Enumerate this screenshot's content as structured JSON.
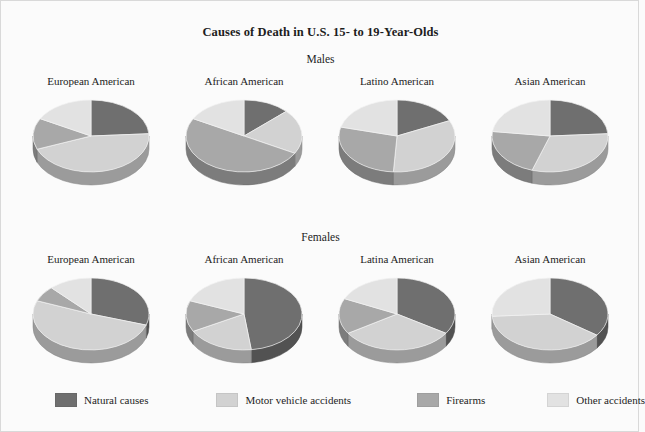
{
  "figure": {
    "title": "Causes of Death in U.S. 15- to 19-Year-Olds",
    "background_color": "#fbfbfb",
    "border_color": "#d9d9d9"
  },
  "sections": [
    {
      "key": "males",
      "label": "Males"
    },
    {
      "key": "females",
      "label": "Females"
    }
  ],
  "legend": {
    "items": [
      {
        "label": "Natural causes",
        "color": "#6f6f6f"
      },
      {
        "label": "Motor vehicle accidents",
        "color": "#d2d2d2"
      },
      {
        "label": "Firearms",
        "color": "#a8a8a8"
      },
      {
        "label": "Other accidents",
        "color": "#e2e2e2"
      }
    ]
  },
  "chart_data": {
    "type": "pie",
    "title": "Causes of Death in U.S. 15- to 19-Year-Olds",
    "categories": [
      "Natural causes",
      "Motor vehicle accidents",
      "Firearms",
      "Other accidents"
    ],
    "colors": [
      "#6f6f6f",
      "#d2d2d2",
      "#a8a8a8",
      "#e2e2e2"
    ],
    "units": "percent",
    "legend_position": "bottom",
    "grid": false,
    "panels": [
      {
        "group": "Males",
        "name": "European American",
        "values": [
          24,
          45,
          14,
          17
        ]
      },
      {
        "group": "Males",
        "name": "African American",
        "values": [
          13,
          20,
          50,
          17
        ]
      },
      {
        "group": "Males",
        "name": "Latino American",
        "values": [
          18,
          33,
          28,
          21
        ]
      },
      {
        "group": "Males",
        "name": "Asian American",
        "values": [
          24,
          31,
          22,
          23
        ]
      },
      {
        "group": "Females",
        "name": "European American",
        "values": [
          30,
          51,
          7,
          12
        ]
      },
      {
        "group": "Females",
        "name": "African American",
        "values": [
          48,
          19,
          14,
          19
        ]
      },
      {
        "group": "Females",
        "name": "Latina American",
        "values": [
          34,
          32,
          16,
          18
        ]
      },
      {
        "group": "Females",
        "name": "Asian American",
        "values": [
          35,
          39,
          0,
          26
        ]
      }
    ]
  }
}
